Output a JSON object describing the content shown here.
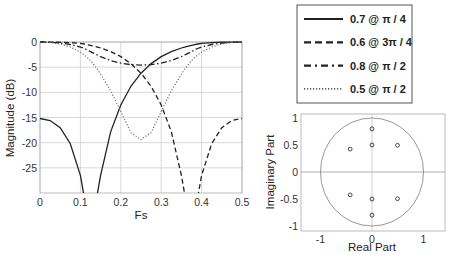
{
  "chart_data": [
    {
      "type": "line",
      "title": "",
      "xlabel": "Fs",
      "ylabel": "Magnitude (dB)",
      "xlim": [
        0,
        0.5
      ],
      "ylim": [
        -30,
        0
      ],
      "xticks": [
        "0",
        "0.1",
        "0.2",
        "0.3",
        "0.4",
        "0.5"
      ],
      "xtick_values": [
        0,
        0.1,
        0.2,
        0.3,
        0.4,
        0.5
      ],
      "yticks": [
        "0",
        "-5",
        "-10",
        "-15",
        "-20",
        "-25"
      ],
      "ytick_values": [
        0,
        -5,
        -10,
        -15,
        -20,
        -25
      ],
      "grid": true,
      "legend_position": "upper right (outside)",
      "x": [
        0,
        0.025,
        0.05,
        0.075,
        0.1,
        0.11,
        0.12,
        0.125,
        0.13,
        0.14,
        0.15,
        0.175,
        0.2,
        0.225,
        0.25,
        0.275,
        0.3,
        0.325,
        0.35,
        0.36,
        0.37,
        0.375,
        0.38,
        0.39,
        0.4,
        0.425,
        0.45,
        0.475,
        0.5
      ],
      "series": [
        {
          "name": "0.7 @ π / 4",
          "style": "solid",
          "values": [
            -15.2,
            -15.6,
            -17.0,
            -20.2,
            -26.5,
            -31,
            -40,
            -60,
            -40,
            -31,
            -26.5,
            -17.8,
            -12.5,
            -8.8,
            -6.2,
            -4.3,
            -2.9,
            -1.9,
            -1.2,
            -0.95,
            -0.75,
            -0.65,
            -0.55,
            -0.4,
            -0.28,
            -0.12,
            -0.04,
            -0.01,
            0
          ]
        },
        {
          "name": "0.6 @ 3π / 4",
          "style": "dashed",
          "values": [
            0,
            -0.01,
            -0.04,
            -0.12,
            -0.28,
            -0.4,
            -0.55,
            -0.65,
            -0.75,
            -0.95,
            -1.2,
            -1.9,
            -2.9,
            -4.3,
            -6.2,
            -8.8,
            -12.5,
            -17.8,
            -26.5,
            -31,
            -40,
            -60,
            -40,
            -31,
            -26.5,
            -20.2,
            -17.0,
            -15.6,
            -15.2
          ]
        },
        {
          "name": "0.8 @ π / 2",
          "style": "dashdot",
          "values": [
            0,
            -0.05,
            -0.2,
            -0.5,
            -1.0,
            -1.3,
            -1.7,
            -1.9,
            -2.1,
            -2.5,
            -2.9,
            -3.7,
            -4.2,
            -4.5,
            -4.6,
            -4.5,
            -4.2,
            -3.7,
            -2.9,
            -2.5,
            -2.1,
            -1.9,
            -1.7,
            -1.3,
            -1.0,
            -0.5,
            -0.2,
            -0.05,
            0
          ]
        },
        {
          "name": "0.5 @ π / 2",
          "style": "dotted",
          "values": [
            0,
            -0.1,
            -0.4,
            -1.0,
            -2.0,
            -2.6,
            -3.3,
            -3.7,
            -4.2,
            -5.2,
            -6.4,
            -9.7,
            -13.8,
            -18.0,
            -19.4,
            -18.0,
            -13.8,
            -9.7,
            -6.4,
            -5.2,
            -4.2,
            -3.7,
            -3.3,
            -2.6,
            -2.0,
            -1.0,
            -0.4,
            -0.1,
            0
          ]
        }
      ]
    },
    {
      "type": "scatter",
      "title": "",
      "xlabel": "Real Part",
      "ylabel": "Imaginary Part",
      "xlim": [
        -1.4,
        1.4
      ],
      "ylim": [
        -1.1,
        1.1
      ],
      "xticks": [
        "-1",
        "0",
        "1"
      ],
      "xtick_values": [
        -1,
        0,
        1
      ],
      "yticks": [
        "1",
        "0.5",
        "0",
        "-0.5",
        "-1"
      ],
      "ytick_values": [
        1,
        0.5,
        0,
        -0.5,
        -1
      ],
      "unit_circle": true,
      "marker": "o",
      "points": [
        {
          "x": 0,
          "y": 0.8
        },
        {
          "x": 0,
          "y": -0.8
        },
        {
          "x": 0,
          "y": 0.5
        },
        {
          "x": 0,
          "y": -0.5
        },
        {
          "x": 0.495,
          "y": 0.495
        },
        {
          "x": 0.495,
          "y": -0.495
        },
        {
          "x": -0.424,
          "y": 0.424
        },
        {
          "x": -0.424,
          "y": -0.424
        }
      ]
    }
  ],
  "legend": {
    "items": [
      {
        "label": "0.7 @ π / 4",
        "style": "solid"
      },
      {
        "label": "0.6 @ 3π / 4",
        "style": "dashed"
      },
      {
        "label": "0.8 @ π / 2",
        "style": "dashdot"
      },
      {
        "label": "0.5 @ π / 2",
        "style": "dotted"
      }
    ]
  },
  "colors": {
    "line": "#222222",
    "grid": "#c8c8c8",
    "axis": "#999999",
    "circle": "#8a8a8a"
  }
}
